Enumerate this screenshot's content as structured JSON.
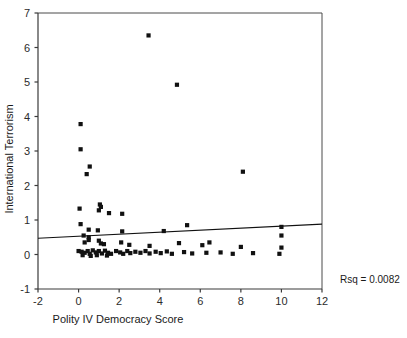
{
  "chart_data": {
    "type": "scatter",
    "title": "",
    "xlabel": "Polity IV Democracy Score",
    "ylabel": "International Terrorism",
    "xlim": [
      -2,
      12
    ],
    "ylim": [
      -1,
      7
    ],
    "xticks": [
      -2,
      0,
      2,
      4,
      6,
      8,
      10,
      12
    ],
    "xticklabels": [
      "-2",
      "0",
      "2",
      "4",
      "6",
      "8",
      "10",
      "12"
    ],
    "yticks": [
      -1,
      0,
      1,
      2,
      3,
      4,
      5,
      6,
      7
    ],
    "yticklabels": [
      "-1",
      "0",
      "1",
      "2",
      "3",
      "4",
      "5",
      "6",
      "7"
    ],
    "grid": false,
    "legend": null,
    "annotations": [
      {
        "text": "Rsq = 0.0082",
        "position": "right-outside",
        "x": 13.9,
        "y": -0.7
      }
    ],
    "fit_line": {
      "label": "linear regression fit",
      "x": [
        -2,
        12
      ],
      "y": [
        0.47,
        0.88
      ],
      "slope": 0.029,
      "intercept": 0.53,
      "r_squared": 0.0082
    },
    "points": [
      {
        "x": 3.45,
        "y": 6.35
      },
      {
        "x": 4.85,
        "y": 4.92
      },
      {
        "x": 0.1,
        "y": 3.78
      },
      {
        "x": 0.1,
        "y": 3.05
      },
      {
        "x": 0.55,
        "y": 2.55
      },
      {
        "x": 0.4,
        "y": 2.33
      },
      {
        "x": 8.1,
        "y": 2.4
      },
      {
        "x": 0.05,
        "y": 1.33
      },
      {
        "x": 1.05,
        "y": 1.45
      },
      {
        "x": 1.1,
        "y": 1.38
      },
      {
        "x": 1.0,
        "y": 1.28
      },
      {
        "x": 1.5,
        "y": 1.2
      },
      {
        "x": 2.15,
        "y": 1.18
      },
      {
        "x": 0.1,
        "y": 0.88
      },
      {
        "x": 0.5,
        "y": 0.72
      },
      {
        "x": 0.95,
        "y": 0.7
      },
      {
        "x": 2.15,
        "y": 0.67
      },
      {
        "x": 5.35,
        "y": 0.85
      },
      {
        "x": 4.2,
        "y": 0.68
      },
      {
        "x": 10.0,
        "y": 0.8
      },
      {
        "x": 10.0,
        "y": 0.55
      },
      {
        "x": 0.25,
        "y": 0.55
      },
      {
        "x": 0.5,
        "y": 0.5
      },
      {
        "x": 0.5,
        "y": 0.42
      },
      {
        "x": 0.3,
        "y": 0.35
      },
      {
        "x": 1.0,
        "y": 0.4
      },
      {
        "x": 1.1,
        "y": 0.32
      },
      {
        "x": 1.25,
        "y": 0.3
      },
      {
        "x": 2.1,
        "y": 0.35
      },
      {
        "x": 2.5,
        "y": 0.28
      },
      {
        "x": 3.5,
        "y": 0.25
      },
      {
        "x": 4.95,
        "y": 0.33
      },
      {
        "x": 6.1,
        "y": 0.27
      },
      {
        "x": 6.45,
        "y": 0.35
      },
      {
        "x": 8.0,
        "y": 0.22
      },
      {
        "x": 10.0,
        "y": 0.2
      },
      {
        "x": 0.0,
        "y": 0.1
      },
      {
        "x": 0.15,
        "y": 0.08
      },
      {
        "x": 0.3,
        "y": 0.05
      },
      {
        "x": 0.45,
        "y": 0.1
      },
      {
        "x": 0.55,
        "y": 0.02
      },
      {
        "x": 0.7,
        "y": 0.12
      },
      {
        "x": 0.85,
        "y": 0.06
      },
      {
        "x": 1.0,
        "y": 0.1
      },
      {
        "x": 1.15,
        "y": 0.03
      },
      {
        "x": 1.3,
        "y": 0.11
      },
      {
        "x": 1.45,
        "y": 0.05
      },
      {
        "x": 1.6,
        "y": 0.02
      },
      {
        "x": 1.85,
        "y": 0.1
      },
      {
        "x": 2.05,
        "y": 0.06
      },
      {
        "x": 2.2,
        "y": 0.02
      },
      {
        "x": 2.4,
        "y": 0.1
      },
      {
        "x": 2.55,
        "y": 0.04
      },
      {
        "x": 2.8,
        "y": 0.08
      },
      {
        "x": 3.05,
        "y": 0.05
      },
      {
        "x": 3.3,
        "y": 0.1
      },
      {
        "x": 3.5,
        "y": 0.03
      },
      {
        "x": 3.8,
        "y": 0.08
      },
      {
        "x": 4.05,
        "y": 0.04
      },
      {
        "x": 4.35,
        "y": 0.09
      },
      {
        "x": 4.6,
        "y": 0.02
      },
      {
        "x": 5.2,
        "y": 0.07
      },
      {
        "x": 5.6,
        "y": 0.03
      },
      {
        "x": 6.3,
        "y": 0.05
      },
      {
        "x": 7.0,
        "y": 0.06
      },
      {
        "x": 7.6,
        "y": 0.02
      },
      {
        "x": 8.6,
        "y": 0.04
      },
      {
        "x": 9.9,
        "y": 0.02
      },
      {
        "x": 0.2,
        "y": -0.02
      },
      {
        "x": 0.6,
        "y": -0.04
      },
      {
        "x": 0.9,
        "y": -0.02
      },
      {
        "x": 1.4,
        "y": -0.03
      }
    ]
  }
}
